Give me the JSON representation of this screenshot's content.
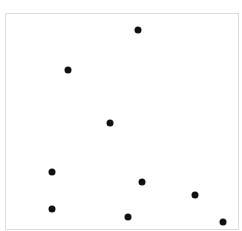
{
  "chart_data": {
    "type": "scatter",
    "title": "",
    "xlabel": "",
    "ylabel": "",
    "grid": false,
    "legend": null,
    "plot_box_px": {
      "left": 5,
      "top": 13,
      "width": 234,
      "height": 217
    },
    "point_color": "#111111",
    "points_px": [
      {
        "x": 138,
        "y": 30
      },
      {
        "x": 68,
        "y": 70
      },
      {
        "x": 110,
        "y": 123
      },
      {
        "x": 52,
        "y": 172
      },
      {
        "x": 142,
        "y": 182
      },
      {
        "x": 195,
        "y": 195
      },
      {
        "x": 52,
        "y": 209
      },
      {
        "x": 128,
        "y": 217
      },
      {
        "x": 223,
        "y": 222
      }
    ]
  }
}
